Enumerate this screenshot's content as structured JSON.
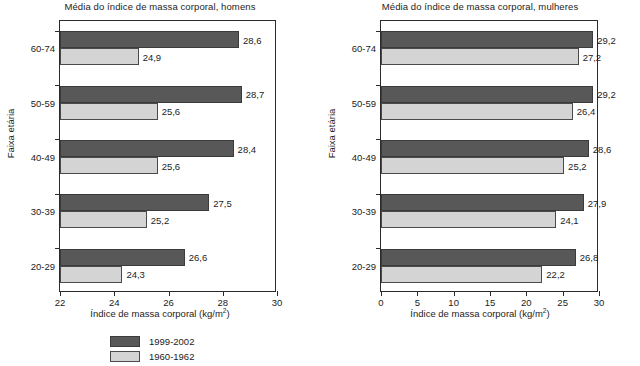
{
  "chart_data": [
    {
      "type": "bar",
      "orientation": "horizontal",
      "title": "Média do índice de massa corporal, homens",
      "xlabel": "Índice de massa corporal (kg/m²)",
      "ylabel": "Faixa etária",
      "categories": [
        "20-29",
        "30-39",
        "40-49",
        "50-59",
        "60-74"
      ],
      "categories_top_to_bottom": [
        "60-74",
        "50-59",
        "40-49",
        "30-39",
        "20-29"
      ],
      "xlim": [
        22,
        30
      ],
      "xticks": [
        22,
        24,
        26,
        28,
        30
      ],
      "xtick_labels": [
        "22",
        "24",
        "26",
        "28",
        "30"
      ],
      "grid": false,
      "legend_position": "below",
      "series": [
        {
          "name": "1999-2002",
          "color": "#585858",
          "values": [
            26.6,
            27.5,
            28.4,
            28.7,
            28.6
          ],
          "labels": [
            "26,6",
            "27,5",
            "28,4",
            "28,7",
            "28,6"
          ]
        },
        {
          "name": "1960-1962",
          "color": "#d4d4d4",
          "values": [
            24.3,
            25.2,
            25.6,
            25.6,
            24.9
          ],
          "labels": [
            "24,3",
            "25,2",
            "25,6",
            "25,6",
            "24,9"
          ]
        }
      ]
    },
    {
      "type": "bar",
      "orientation": "horizontal",
      "title": "Média do índice de massa corporal, mulheres",
      "xlabel": "Índice de massa corporal (kg/m²)",
      "ylabel": "Faixa etária",
      "categories": [
        "20-29",
        "30-39",
        "40-49",
        "50-59",
        "60-74"
      ],
      "categories_top_to_bottom": [
        "60-74",
        "50-59",
        "40-49",
        "30-39",
        "20-29"
      ],
      "xlim": [
        0,
        30
      ],
      "xticks": [
        0,
        5,
        10,
        15,
        20,
        25,
        30
      ],
      "xtick_labels": [
        "0",
        "5",
        "10",
        "15",
        "20",
        "25",
        "30"
      ],
      "grid": false,
      "legend_position": "below",
      "series": [
        {
          "name": "1999-2002",
          "color": "#585858",
          "values": [
            26.8,
            27.9,
            28.6,
            29.2,
            29.2
          ],
          "labels": [
            "26,8",
            "27,9",
            "28,6",
            "29,2",
            "29,2"
          ]
        },
        {
          "name": "1960-1962",
          "color": "#d4d4d4",
          "values": [
            22.2,
            24.1,
            25.2,
            26.4,
            27.2
          ],
          "labels": [
            "22,2",
            "24,1",
            "25,2",
            "26,4",
            "27,2"
          ]
        }
      ]
    }
  ],
  "panels": [
    {
      "id": "homens",
      "title": "Média do índice de massa corporal, homens",
      "x_axis_title_main": "Índice de massa corporal (kg/m",
      "x_axis_title_sup": "2",
      "x_axis_title_end": ")",
      "y_axis_title": "Faixa etária",
      "xtick_labels": [
        "22",
        "24",
        "26",
        "28",
        "30"
      ],
      "groups": [
        {
          "label": "60-74",
          "dark_label": "28,6",
          "light_label": "24,9"
        },
        {
          "label": "50-59",
          "dark_label": "28,7",
          "light_label": "25,6"
        },
        {
          "label": "40-49",
          "dark_label": "28,4",
          "light_label": "25,6"
        },
        {
          "label": "30-39",
          "dark_label": "27,5",
          "light_label": "25,2"
        },
        {
          "label": "20-29",
          "dark_label": "26,6",
          "light_label": "24,3"
        }
      ],
      "legend": [
        {
          "label": "1999-2002"
        },
        {
          "label": "1960-1962"
        }
      ]
    },
    {
      "id": "mulheres",
      "title": "Média do índice de massa corporal, mulheres",
      "x_axis_title_main": "Índice de massa corporal (kg/m",
      "x_axis_title_sup": "2",
      "x_axis_title_end": ")",
      "y_axis_title": "Faixa etária",
      "xtick_labels": [
        "0",
        "5",
        "10",
        "15",
        "20",
        "25",
        "30"
      ],
      "groups": [
        {
          "label": "60-74",
          "dark_label": "29,2",
          "light_label": "27,2"
        },
        {
          "label": "50-59",
          "dark_label": "29,2",
          "light_label": "26,4"
        },
        {
          "label": "40-49",
          "dark_label": "28,6",
          "light_label": "25,2"
        },
        {
          "label": "30-39",
          "dark_label": "27,9",
          "light_label": "24,1"
        },
        {
          "label": "20-29",
          "dark_label": "26,8",
          "light_label": "22,2"
        }
      ],
      "legend": [
        {
          "label": "1999-2002"
        },
        {
          "label": "1960-1962"
        }
      ]
    }
  ],
  "colors": {
    "series_1999_2002": "#585858",
    "series_1960_1962": "#d4d4d4",
    "axis": "#2b2b2b",
    "text": "#1c1c1c",
    "background": "#ffffff"
  }
}
